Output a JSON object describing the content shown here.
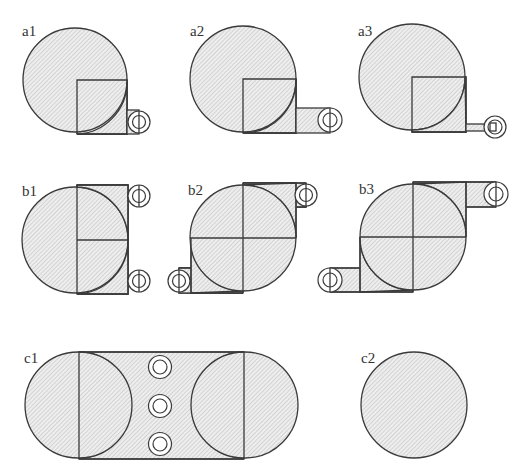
{
  "figure": {
    "background": "#ffffff",
    "stroke_color": "#3a3a3a",
    "hatch_color": "#b8b8b8",
    "fill_color": "#eeeeee",
    "panels": [
      {
        "id": "a1",
        "label": "a1",
        "label_pos": [
          22,
          36
        ]
      },
      {
        "id": "a2",
        "label": "a2",
        "label_pos": [
          190,
          36
        ]
      },
      {
        "id": "a3",
        "label": "a3",
        "label_pos": [
          358,
          36
        ]
      },
      {
        "id": "b1",
        "label": "b1",
        "label_pos": [
          22,
          196
        ]
      },
      {
        "id": "b2",
        "label": "b2",
        "label_pos": [
          188,
          195
        ]
      },
      {
        "id": "b3",
        "label": "b3",
        "label_pos": [
          359,
          194
        ]
      },
      {
        "id": "c1",
        "label": "c1",
        "label_pos": [
          24,
          363
        ]
      },
      {
        "id": "c2",
        "label": "c2",
        "label_pos": [
          361,
          363
        ]
      }
    ]
  }
}
